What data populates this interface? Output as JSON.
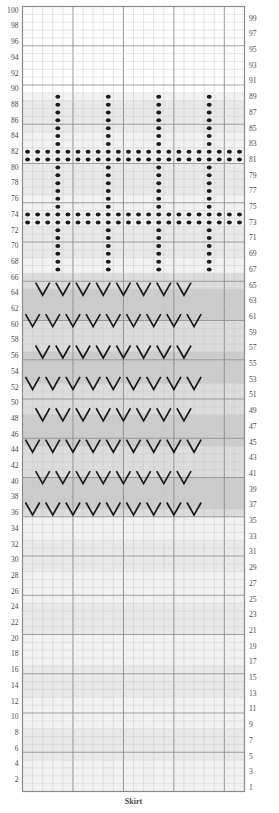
{
  "chart_title": "Skirt",
  "caption": "Skirt",
  "grid": {
    "columns": 22,
    "rows": 100,
    "left_label_parity": "even",
    "right_label_parity": "odd",
    "left_labels": [
      2,
      4,
      6,
      8,
      10,
      12,
      14,
      16,
      18,
      20,
      22,
      24,
      26,
      28,
      30,
      32,
      34,
      36,
      38,
      40,
      42,
      44,
      46,
      48,
      50,
      52,
      54,
      56,
      58,
      60,
      62,
      64,
      66,
      68,
      70,
      72,
      74,
      76,
      78,
      80,
      82,
      84,
      86,
      88,
      90,
      92,
      94,
      96,
      98,
      100
    ],
    "right_labels": [
      1,
      3,
      5,
      7,
      9,
      11,
      13,
      15,
      17,
      19,
      21,
      23,
      25,
      27,
      29,
      31,
      33,
      35,
      37,
      39,
      41,
      43,
      45,
      47,
      49,
      51,
      53,
      55,
      57,
      59,
      61,
      63,
      65,
      67,
      69,
      71,
      73,
      75,
      77,
      79,
      81,
      83,
      85,
      87,
      89,
      91,
      93,
      95,
      97,
      99
    ]
  },
  "colors": {
    "grid_line": "#c9c9c9",
    "grid_line_major": "#8a8a8a",
    "border": "#8a8a8a",
    "symbol": "#1a1a1a",
    "label": "#4a4a4a",
    "band_light": "#f2f2f2",
    "band_mid": "#dcdcdc",
    "band_dark": "#bcbcbc",
    "band_white": "#ffffff",
    "background": "#ffffff"
  },
  "legend": {
    "dot_symbol_name": "purl-bobble-dot",
    "v_symbol_name": "v-stitch"
  },
  "chart_data": {
    "type": "heatmap",
    "title": "Skirt",
    "xlabel": "",
    "ylabel": "",
    "columns": 22,
    "rows": 100,
    "symbols": {
      "empty": "",
      "dot": "●",
      "v": "V"
    },
    "row_shading": [
      {
        "from": 1,
        "to": 35,
        "shade": "band_light"
      },
      {
        "from": 36,
        "to": 66,
        "shade": "band_mid"
      },
      {
        "from": 67,
        "to": 89,
        "shade": "band_light"
      },
      {
        "from": 90,
        "to": 100,
        "shade": "band_white"
      }
    ],
    "dot_rows_full": [
      73,
      74,
      81,
      82
    ],
    "dot_columns_vertical": [
      4,
      9,
      14,
      19
    ],
    "dot_vertical_range": [
      67,
      89
    ],
    "v_rows": [
      37,
      41,
      45,
      49,
      53,
      57,
      61,
      65
    ],
    "v_rows_offset_a": [
      37,
      45,
      53,
      61
    ],
    "v_rows_offset_b": [
      41,
      49,
      57,
      65
    ],
    "v_count_offset_a": 9,
    "v_count_offset_b": 8,
    "v_columns_offset_a": [
      1,
      3,
      5,
      7,
      9,
      11,
      13,
      15,
      17
    ],
    "v_columns_offset_b": [
      2,
      4,
      6,
      8,
      10,
      12,
      14,
      16
    ],
    "plain_rows": [
      1,
      2,
      3,
      4,
      5,
      6,
      7,
      8,
      9,
      10,
      11,
      12,
      13,
      14,
      15,
      16,
      17,
      18,
      19,
      20,
      21,
      22,
      23,
      24,
      25,
      26,
      27,
      28,
      29,
      30,
      31,
      32,
      33,
      34,
      35,
      90,
      91,
      92,
      93,
      94,
      95,
      96,
      97,
      98,
      99,
      100
    ]
  }
}
